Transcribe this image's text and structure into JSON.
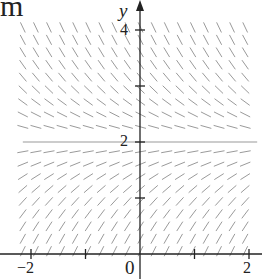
{
  "figure": {
    "corner_fragment": "m",
    "y_axis_label": "y",
    "x_axis_label": "x",
    "tick_labels": {
      "y4": "4",
      "y2": "2",
      "xm2": "−2",
      "x0": "0",
      "x2": "2"
    },
    "colors": {
      "axis": "#222222",
      "segments": "#9a9a9a",
      "equilibrium": "#9a9a9a",
      "background": "#ffffff"
    }
  },
  "chart_data": {
    "type": "slope_field",
    "title": "",
    "equation": "dy/dx = 2 - y",
    "xlabel": "x",
    "ylabel": "y",
    "xlim": [
      -2.2,
      2.2
    ],
    "ylim": [
      0,
      4.2
    ],
    "x_ticks": [
      -2,
      -1,
      0,
      1,
      2
    ],
    "x_tick_labels": [
      "−2",
      "",
      "0",
      "",
      "2"
    ],
    "y_ticks": [
      1,
      2,
      3,
      4
    ],
    "y_tick_labels": [
      "",
      "2",
      "",
      "4"
    ],
    "grid": false,
    "segment_grid": {
      "x_start": -2.15,
      "x_end": 2.15,
      "x_step": 0.24,
      "y_start": 0.05,
      "y_end": 4.05,
      "y_step": 0.222
    },
    "equilibrium_solution": {
      "y": 2,
      "x_range": [
        -2.15,
        2.15
      ]
    },
    "pixel_mapping": {
      "origin_px": [
        140,
        254
      ],
      "px_per_unit_x": 54.5,
      "px_per_unit_y": 56
    }
  }
}
